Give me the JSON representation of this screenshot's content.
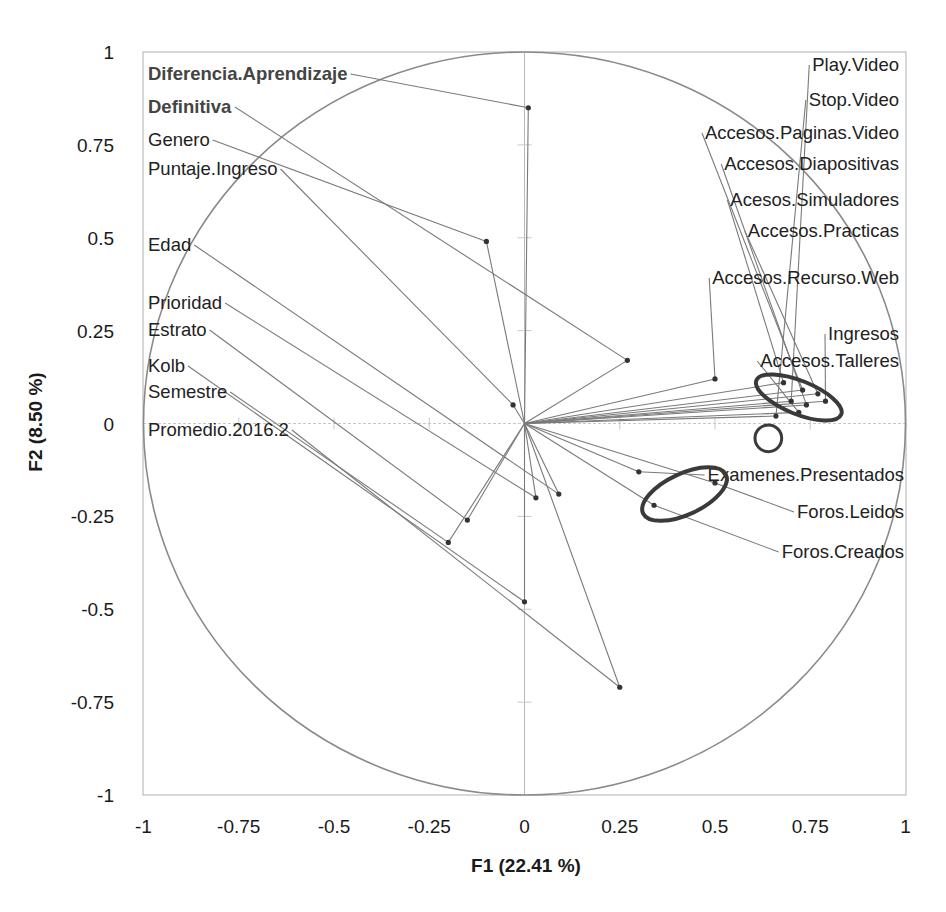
{
  "chart_data": {
    "type": "scatter",
    "subtype": "correlation-circle (PCA variables plot)",
    "title": "",
    "xlabel": "F1 (22.41 %)",
    "ylabel": "F2 (8.50 %)",
    "xlim": [
      -1,
      1
    ],
    "ylim": [
      -1,
      1
    ],
    "x_ticks": [
      "-1",
      "-0.75",
      "-0.5",
      "-0.25",
      "0",
      "0.25",
      "0.5",
      "0.75",
      "1"
    ],
    "y_ticks": [
      "1",
      "0.75",
      "0.5",
      "0.25",
      "0",
      "-0.25",
      "-0.5",
      "-0.75",
      "-1"
    ],
    "grid": false,
    "unit_circle": true,
    "legend": "none",
    "colors": {
      "lines": "#7a7a7a",
      "points": "#333333",
      "highlight": "#3a3a3a",
      "circle": "#8a8a8a",
      "frame": "#b0b0b0"
    },
    "variables": [
      {
        "name": "Diferencia.Aprendizaje",
        "x": 0.01,
        "y": 0.85,
        "bold": true,
        "lx": 148,
        "ly": 74
      },
      {
        "name": "Definitiva",
        "x": 0.27,
        "y": 0.17,
        "bold": true,
        "lx": 148,
        "ly": 107
      },
      {
        "name": "Genero",
        "x": -0.1,
        "y": 0.49,
        "bold": false,
        "lx": 148,
        "ly": 140
      },
      {
        "name": "Puntaje.Ingreso",
        "x": -0.03,
        "y": 0.05,
        "bold": false,
        "lx": 148,
        "ly": 169
      },
      {
        "name": "Edad",
        "x": 0.09,
        "y": -0.19,
        "bold": false,
        "lx": 148,
        "ly": 245
      },
      {
        "name": "Prioridad",
        "x": 0.03,
        "y": -0.2,
        "bold": false,
        "lx": 148,
        "ly": 303
      },
      {
        "name": "Estrato",
        "x": -0.15,
        "y": -0.26,
        "bold": false,
        "lx": 148,
        "ly": 330
      },
      {
        "name": "Kolb",
        "x": 0.0,
        "y": -0.48,
        "bold": false,
        "lx": 148,
        "ly": 366
      },
      {
        "name": "Semestre",
        "x": -0.2,
        "y": -0.32,
        "bold": false,
        "lx": 148,
        "ly": 392
      },
      {
        "name": "Promedio.2016.2",
        "x": 0.25,
        "y": -0.71,
        "bold": false,
        "lx": 148,
        "ly": 430
      },
      {
        "name": "Play.Video",
        "x": 0.7,
        "y": 0.06,
        "bold": false,
        "lx": 899,
        "ly": 65,
        "anchor": "end"
      },
      {
        "name": "Stop.Video",
        "x": 0.66,
        "y": 0.02,
        "bold": false,
        "lx": 899,
        "ly": 100,
        "anchor": "end"
      },
      {
        "name": "Accesos.Paginas.Video",
        "x": 0.73,
        "y": 0.09,
        "bold": false,
        "lx": 899,
        "ly": 133,
        "anchor": "end"
      },
      {
        "name": "Accesos.Diapositivas",
        "x": 0.74,
        "y": 0.05,
        "bold": false,
        "lx": 899,
        "ly": 164,
        "anchor": "end"
      },
      {
        "name": "Acesos.Simuladores",
        "x": 0.68,
        "y": 0.11,
        "bold": false,
        "lx": 899,
        "ly": 200,
        "anchor": "end"
      },
      {
        "name": "Accesos.Practicas",
        "x": 0.77,
        "y": 0.08,
        "bold": false,
        "lx": 899,
        "ly": 231,
        "anchor": "end"
      },
      {
        "name": "Accesos.Recurso.Web",
        "x": 0.5,
        "y": 0.12,
        "bold": false,
        "lx": 899,
        "ly": 278,
        "anchor": "end"
      },
      {
        "name": "Ingresos",
        "x": 0.79,
        "y": 0.06,
        "bold": false,
        "lx": 899,
        "ly": 334,
        "anchor": "end"
      },
      {
        "name": "Accesos.Talleres",
        "x": 0.72,
        "y": 0.03,
        "bold": false,
        "lx": 899,
        "ly": 361,
        "anchor": "end"
      },
      {
        "name": "Examenes.Presentados",
        "x": 0.3,
        "y": -0.13,
        "bold": false,
        "lx": 904,
        "ly": 475,
        "anchor": "end"
      },
      {
        "name": "Foros.Leidos",
        "x": 0.5,
        "y": -0.16,
        "bold": false,
        "lx": 904,
        "ly": 512,
        "anchor": "end"
      },
      {
        "name": "Foros.Creados",
        "x": 0.34,
        "y": -0.22,
        "bold": false,
        "lx": 904,
        "ly": 552,
        "anchor": "end"
      }
    ],
    "annotations": [
      {
        "shape": "ellipse",
        "cx": 0.72,
        "cy": 0.07,
        "rx": 0.12,
        "ry": 0.045,
        "rotate": 22,
        "note": "cluster of access variables"
      },
      {
        "shape": "circle",
        "cx": 0.64,
        "cy": -0.04,
        "r": 0.035,
        "note": "small cluster"
      },
      {
        "shape": "ellipse",
        "cx": 0.42,
        "cy": -0.19,
        "rx": 0.12,
        "ry": 0.055,
        "rotate": -25,
        "note": "forum variables"
      }
    ]
  }
}
